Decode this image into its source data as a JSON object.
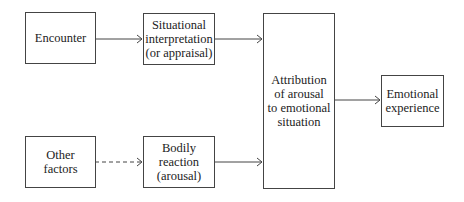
{
  "diagram": {
    "nodes": {
      "encounter": {
        "label": "Encounter"
      },
      "interpretation": {
        "label": "Situational\ninterpretation\n(or appraisal)"
      },
      "other_factors": {
        "label": "Other\nfactors"
      },
      "bodily_reaction": {
        "label": "Bodily\nreaction\n(arousal)"
      },
      "attribution": {
        "label": "Attribution\nof arousal\nto emotional\nsituation"
      },
      "emotional_experience": {
        "label": "Emotional\nexperience"
      }
    },
    "edges": [
      {
        "from": "encounter",
        "to": "interpretation",
        "style": "solid"
      },
      {
        "from": "interpretation",
        "to": "attribution",
        "style": "solid"
      },
      {
        "from": "other_factors",
        "to": "bodily_reaction",
        "style": "dashed"
      },
      {
        "from": "bodily_reaction",
        "to": "attribution",
        "style": "solid"
      },
      {
        "from": "attribution",
        "to": "emotional_experience",
        "style": "solid"
      }
    ],
    "colors": {
      "line": "#444444",
      "background": "#ffffff"
    }
  }
}
